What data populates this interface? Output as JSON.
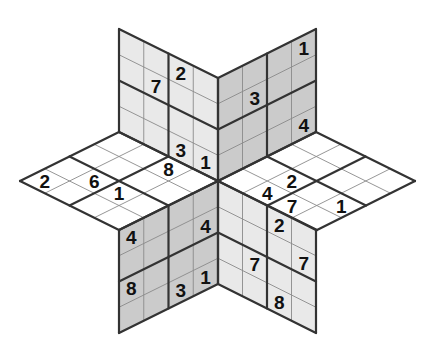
{
  "puzzle": {
    "type": "star-sudoku-isometric",
    "cells_per_side": 4,
    "colors": {
      "dark_panel": "#cbcbcb",
      "light_panel": "#e9e9e9",
      "top_panel": "#ffffff",
      "thick_line": "#333333",
      "thin_line": "#8a8a8a",
      "digit": "#111111"
    },
    "panels": [
      {
        "id": "upper-left",
        "fill": "light",
        "origin": [
          119,
          29
        ],
        "a": [
          99,
          49
        ],
        "b": [
          0,
          103
        ],
        "givens": [
          {
            "a": 2,
            "b": 0,
            "value": "2"
          },
          {
            "a": 1,
            "b": 1,
            "value": "7"
          },
          {
            "a": 2,
            "b": 3,
            "value": "3"
          },
          {
            "a": 3,
            "b": 3,
            "value": "1"
          }
        ]
      },
      {
        "id": "upper-right",
        "fill": "dark",
        "origin": [
          218,
          78
        ],
        "a": [
          98,
          -49
        ],
        "b": [
          0,
          103
        ],
        "givens": [
          {
            "a": 3,
            "b": 0,
            "value": "1"
          },
          {
            "a": 1,
            "b": 1,
            "value": "3"
          },
          {
            "a": 3,
            "b": 3,
            "value": "4"
          }
        ]
      },
      {
        "id": "left",
        "fill": "top",
        "origin": [
          119,
          132
        ],
        "a": [
          -99,
          49
        ],
        "b": [
          99,
          49
        ],
        "givens": [
          {
            "a": 3,
            "b": 0,
            "value": "2"
          },
          {
            "a": 2,
            "b": 1,
            "value": "6"
          },
          {
            "a": 2,
            "b": 2,
            "value": "1"
          },
          {
            "a": 0,
            "b": 2,
            "value": "8"
          }
        ]
      },
      {
        "id": "right",
        "fill": "top",
        "origin": [
          316,
          132
        ],
        "a": [
          -98,
          49
        ],
        "b": [
          99,
          49
        ],
        "givens": [
          {
            "a": 2,
            "b": 1,
            "value": "2"
          },
          {
            "a": 3,
            "b": 1,
            "value": "4"
          },
          {
            "a": 3,
            "b": 2,
            "value": "7"
          },
          {
            "a": 2,
            "b": 3,
            "value": "1"
          }
        ]
      },
      {
        "id": "lower-left",
        "fill": "dark",
        "origin": [
          119,
          230
        ],
        "a": [
          99,
          -49
        ],
        "b": [
          0,
          103
        ],
        "givens": [
          {
            "a": 0,
            "b": 0,
            "value": "4"
          },
          {
            "a": 3,
            "b": 1,
            "value": "4"
          },
          {
            "a": 0,
            "b": 2,
            "value": "8"
          },
          {
            "a": 2,
            "b": 3,
            "value": "3"
          },
          {
            "a": 3,
            "b": 3,
            "value": "1"
          }
        ]
      },
      {
        "id": "lower-right",
        "fill": "light",
        "origin": [
          218,
          181
        ],
        "a": [
          98,
          49
        ],
        "b": [
          0,
          103
        ],
        "givens": [
          {
            "a": 2,
            "b": 0,
            "value": "2"
          },
          {
            "a": 3,
            "b": 1,
            "value": "7"
          },
          {
            "a": 1,
            "b": 2,
            "value": "7"
          },
          {
            "a": 2,
            "b": 3,
            "value": "8"
          }
        ]
      }
    ]
  }
}
